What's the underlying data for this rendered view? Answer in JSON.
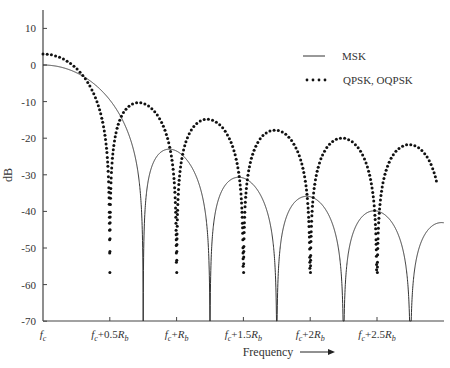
{
  "chart_data": {
    "type": "line",
    "title": "",
    "xlabel": "Frequency",
    "ylabel": "dB",
    "ylim": [
      -70,
      15
    ],
    "yticks": [
      10,
      0,
      -10,
      -20,
      -30,
      -40,
      -50,
      -60,
      -70
    ],
    "xticks": [
      "fc",
      "fc+0.5Rb",
      "fc+Rb",
      "fc+1.5Rb",
      "fc+2Rb",
      "fc+2.5Rb"
    ],
    "xtick_values_Rb": [
      0,
      0.5,
      1.0,
      1.5,
      2.0,
      2.5
    ],
    "xlim_Rb": [
      0,
      3.0
    ],
    "grid": false,
    "legend_position": "upper right",
    "series": [
      {
        "name": "MSK",
        "style": "solid",
        "x_Rb": [
          0,
          0.25,
          0.5,
          0.75,
          1.0,
          1.25,
          1.5,
          1.75,
          2.0,
          2.25,
          2.5,
          2.75,
          3.0
        ],
        "values_dB": [
          0,
          -3.1,
          -12.9,
          -70,
          -23.3,
          -30.5,
          -70,
          -35.8,
          -70,
          -39.8,
          -70,
          -43.2,
          -70
        ],
        "sidelobe_peaks_dB": [
          -23,
          -31,
          -36,
          -40,
          -43
        ]
      },
      {
        "name": "QPSK, OQPSK",
        "style": "dotted",
        "x_Rb": [
          0,
          0.25,
          0.5,
          0.75,
          1.0,
          1.25,
          1.5,
          1.75,
          2.0,
          2.25,
          2.5,
          2.75,
          3.0
        ],
        "values_dB": [
          3,
          -0.9,
          -70,
          -10.5,
          -70,
          -14.9,
          -70,
          -17.8,
          -70,
          -20.0,
          -70,
          -21.8,
          -70
        ],
        "sidelobe_peaks_dB": [
          -10.5,
          -15,
          -18,
          -20,
          -22
        ]
      }
    ]
  },
  "legend": {
    "msk_label": "MSK",
    "qpsk_label": "QPSK, OQPSK"
  },
  "axes": {
    "ylabel": "dB",
    "xlabel": "Frequency",
    "yticks": [
      "10",
      "0",
      "-10",
      "-20",
      "-30",
      "-40",
      "-50",
      "-60",
      "-70"
    ],
    "xticks": [
      {
        "main": "f",
        "sub": "c",
        "rest": ""
      },
      {
        "main": "f",
        "sub": "c",
        "rest": "+0.5R",
        "rsub": "b"
      },
      {
        "main": "f",
        "sub": "c",
        "rest": "+R",
        "rsub": "b"
      },
      {
        "main": "f",
        "sub": "c",
        "rest": "+1.5R",
        "rsub": "b"
      },
      {
        "main": "f",
        "sub": "c",
        "rest": "+2R",
        "rsub": "b"
      },
      {
        "main": "f",
        "sub": "c",
        "rest": "+2.5R",
        "rsub": "b"
      }
    ]
  },
  "colors": {
    "axis": "#444444",
    "msk_line": "#333333",
    "qpsk_dots": "#111111"
  }
}
